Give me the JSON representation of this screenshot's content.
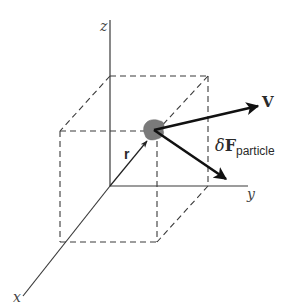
{
  "diagram": {
    "axes": {
      "x_label": "x",
      "y_label": "y",
      "z_label": "z"
    },
    "vectors": {
      "velocity_label": "V",
      "position_label": "r",
      "force_delta": "δ",
      "force_symbol": "F",
      "force_subscript": "particle"
    },
    "colors": {
      "line": "#3a3a3a",
      "arrow": "#111111",
      "particle": "#7a7a7a",
      "background": "#ffffff"
    }
  }
}
